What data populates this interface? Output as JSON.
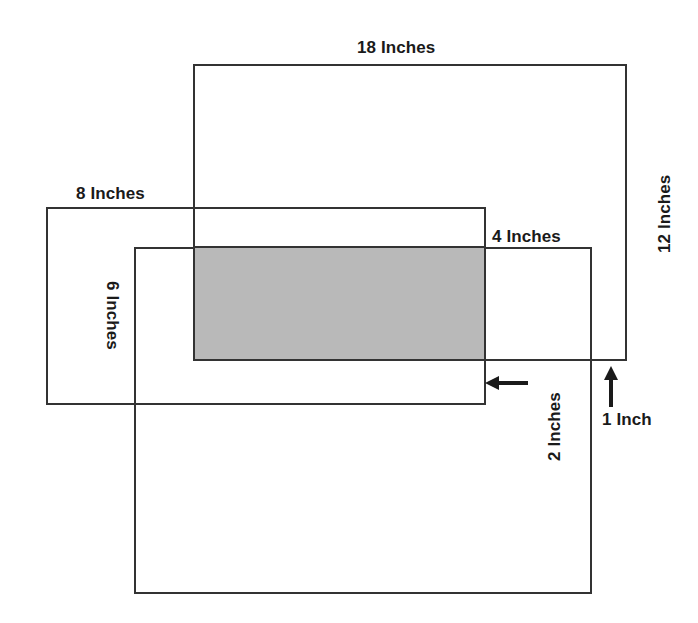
{
  "diagram": {
    "background_color": "#ffffff",
    "stroke_color": "#333333",
    "shade_color": "#b9b9b9",
    "text_color": "#1a1a1a",
    "labels": {
      "top_width": "18 Inches",
      "right_height": "12 Inches",
      "middle_width": "8 Inches",
      "bottom_top_width": "4 Inches",
      "left_height": "6 Inches",
      "horizontal_offset": "2 Inches",
      "vertical_offset": "1 Inch"
    },
    "rectangles": [
      {
        "name": "large-rectangle",
        "width_label": "18 Inches",
        "height_label": "12 Inches",
        "x": 193,
        "y": 64,
        "w": 434,
        "h": 297
      },
      {
        "name": "middle-rectangle",
        "width_label": "8 Inches",
        "x": 46,
        "y": 207,
        "w": 440,
        "h": 198
      },
      {
        "name": "bottom-rectangle",
        "width_label": "4 Inches",
        "height_label": "6 Inches",
        "x": 134,
        "y": 247,
        "w": 458,
        "h": 347
      }
    ],
    "shaded_region": {
      "name": "overlap-region",
      "x": 193,
      "y": 247,
      "w": 293,
      "h": 114,
      "color": "#b9b9b9"
    },
    "arrows": [
      {
        "name": "horizontal-offset-arrow",
        "direction": "left",
        "label": "2 Inches"
      },
      {
        "name": "vertical-offset-arrow",
        "direction": "up",
        "label": "1 Inch"
      }
    ]
  }
}
